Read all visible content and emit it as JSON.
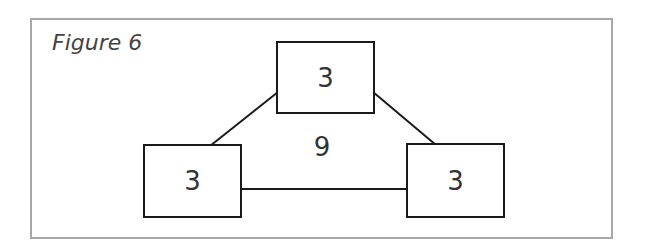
{
  "figure": {
    "caption": "Figure 6",
    "center_label": "9",
    "nodes": [
      {
        "id": "top",
        "label": "3"
      },
      {
        "id": "left",
        "label": "3"
      },
      {
        "id": "right",
        "label": "3"
      }
    ],
    "edges": [
      {
        "from": "top",
        "to": "left"
      },
      {
        "from": "top",
        "to": "right"
      },
      {
        "from": "left",
        "to": "right"
      }
    ],
    "colors": {
      "frame": "#a8a8a8",
      "stroke": "#1a1a1a",
      "text": "#333333"
    }
  }
}
